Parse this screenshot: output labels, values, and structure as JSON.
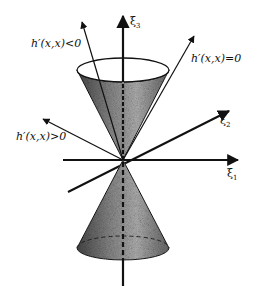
{
  "diagram": {
    "type": "double light cone with axes",
    "axes": {
      "xi1": {
        "symbol": "ξ",
        "sub": "1"
      },
      "xi2": {
        "symbol": "ξ",
        "sub": "2"
      },
      "xi3": {
        "symbol": "ξ",
        "sub": "3"
      }
    },
    "labels": {
      "negative": "h′(x,x)<0",
      "zero": "h′(x,x)=0",
      "positive": "h′(x,x)>0"
    },
    "colors": {
      "ink": "#111111",
      "fill_dark": "#5a5a5a",
      "fill_light": "#cfcfcf",
      "background": "#ffffff"
    }
  }
}
